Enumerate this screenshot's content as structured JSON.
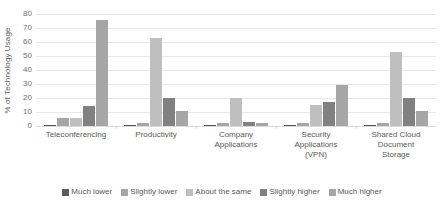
{
  "chart_data": {
    "type": "bar",
    "title": "",
    "subtitle": "",
    "xlabel": "",
    "ylabel": "% of Technology Usage",
    "ylim": [
      0,
      80
    ],
    "yticks": [
      0,
      10,
      20,
      30,
      40,
      50,
      60,
      70,
      80
    ],
    "ytick_labels": [
      "0",
      "10",
      "20",
      "30",
      "40",
      "50",
      "60",
      "70",
      "80"
    ],
    "grid": true,
    "legend_position": "bottom",
    "orientation": "vertical",
    "grouping": "clustered",
    "categories": [
      "Teleconferencing",
      "Productivity",
      "Company Applications",
      "Security Applications (VPN)",
      "Shared Cloud Document Storage"
    ],
    "category_label_lines": [
      [
        "Teleconferencing"
      ],
      [
        "Productivity"
      ],
      [
        "Company",
        "Applications"
      ],
      [
        "Security",
        "Applications",
        "(VPN)"
      ],
      [
        "Shared Cloud",
        "Document",
        "Storage"
      ]
    ],
    "series": [
      {
        "name": "Much lower",
        "color": "#595959",
        "values": [
          1,
          1,
          1,
          1,
          1
        ]
      },
      {
        "name": "Slightly lower",
        "color": "#a6a6a6",
        "values": [
          6,
          2,
          2,
          2,
          2
        ]
      },
      {
        "name": "About the same",
        "color": "#bfbfbf",
        "values": [
          6,
          63,
          20,
          15,
          53
        ]
      },
      {
        "name": "Slightly higher",
        "color": "#808080",
        "values": [
          14,
          20,
          3,
          17,
          20
        ]
      },
      {
        "name": "Much higher",
        "color": "#a6a6a6",
        "values": [
          76,
          11,
          2,
          29,
          11
        ]
      }
    ]
  },
  "legend": {
    "items": [
      {
        "label": "Much lower",
        "color": "#595959"
      },
      {
        "label": "Slightly lower",
        "color": "#a6a6a6"
      },
      {
        "label": "About the same",
        "color": "#bfbfbf"
      },
      {
        "label": "Slightly higher",
        "color": "#808080"
      },
      {
        "label": "Much higher",
        "color": "#a6a6a6"
      }
    ]
  }
}
